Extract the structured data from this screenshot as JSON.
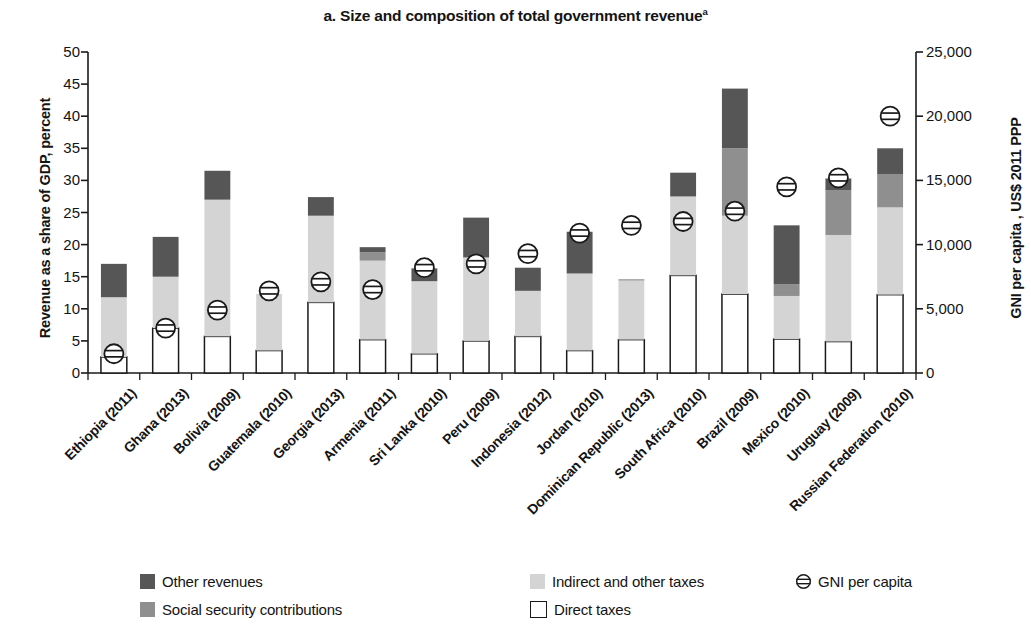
{
  "chart_data": {
    "type": "bar",
    "title": "a. Size and composition of total government revenue",
    "title_superscript": "a",
    "stacked": true,
    "xlabel": "",
    "ylabel": "Revenue as a share of GDP, percent",
    "ylabel_right": "GNI per capita , US$ 2011 PPP",
    "ylim": [
      0,
      50
    ],
    "ylim_right": [
      0,
      25000
    ],
    "yticks": [
      "0",
      "5",
      "10",
      "15",
      "20",
      "25",
      "30",
      "35",
      "40",
      "45",
      "50"
    ],
    "ytick_values": [
      0,
      5,
      10,
      15,
      20,
      25,
      30,
      35,
      40,
      45,
      50
    ],
    "yticks_right": [
      "0",
      "5,000",
      "10,000",
      "15,000",
      "20,000",
      "25,000"
    ],
    "ytick_values_right": [
      0,
      5000,
      10000,
      15000,
      20000,
      25000
    ],
    "grid": false,
    "legend_position": "bottom",
    "categories": [
      "Ethiopia (2011)",
      "Ghana (2013)",
      "Bolivia (2009)",
      "Guatemala (2010)",
      "Georgia (2013)",
      "Armenia (2011)",
      "Sri Lanka (2010)",
      "Peru (2009)",
      "Indonesia (2012)",
      "Jordan (2010)",
      "Dominican Republic (2013)",
      "South Africa (2010)",
      "Brazil (2009)",
      "Mexico (2010)",
      "Uruguay (2009)",
      "Russian Federation (2010)"
    ],
    "series": [
      {
        "name": "Direct taxes",
        "color": "#ffffff",
        "stroke": "#1a1a1a",
        "values": [
          2.5,
          7.0,
          5.7,
          3.5,
          11.0,
          5.2,
          3.0,
          5.0,
          5.7,
          3.5,
          5.2,
          15.2,
          12.3,
          5.3,
          4.9,
          12.2
        ]
      },
      {
        "name": "Indirect and other taxes",
        "color": "#d4d4d4",
        "values": [
          9.3,
          8.0,
          21.3,
          8.8,
          13.5,
          12.3,
          11.3,
          13.0,
          7.1,
          12.0,
          9.2,
          12.3,
          12.2,
          6.7,
          16.6,
          13.6
        ]
      },
      {
        "name": "Social security contributions",
        "color": "#8f8f8f",
        "values": [
          0.0,
          0.0,
          0.0,
          0.0,
          0.0,
          1.3,
          0.0,
          0.0,
          0.0,
          0.0,
          0.2,
          0.0,
          10.5,
          1.8,
          7.0,
          5.2
        ]
      },
      {
        "name": "Other revenues",
        "color": "#565656",
        "values": [
          5.2,
          6.2,
          4.5,
          0.0,
          2.9,
          0.8,
          2.0,
          6.2,
          3.6,
          6.5,
          0.0,
          3.7,
          9.3,
          9.2,
          1.8,
          4.0
        ]
      }
    ],
    "totals": [
      17.0,
      21.2,
      31.5,
      12.3,
      27.4,
      19.6,
      16.3,
      24.2,
      16.4,
      22.0,
      14.6,
      31.2,
      44.3,
      23.0,
      30.3,
      35.0
    ],
    "gni_series": {
      "name": "GNI per capita",
      "marker": "circle-with-two-lines",
      "axis": "right",
      "values": [
        1500,
        3500,
        4900,
        6400,
        7100,
        6500,
        8200,
        8500,
        9300,
        10900,
        11500,
        11800,
        12600,
        14500,
        15200,
        20000
      ],
      "values_on_left_scale": [
        3.0,
        7.0,
        9.8,
        12.8,
        14.2,
        13.0,
        16.4,
        17.0,
        18.6,
        21.8,
        23.0,
        23.6,
        25.2,
        29.0,
        30.4,
        40.0
      ]
    },
    "legend": [
      {
        "label": "Other revenues",
        "type": "swatch",
        "color": "#565656"
      },
      {
        "label": "Indirect and other taxes",
        "type": "swatch",
        "color": "#d4d4d4"
      },
      {
        "label": "GNI per capita",
        "type": "marker",
        "color": "#1a1a1a"
      },
      {
        "label": "Social security contributions",
        "type": "swatch",
        "color": "#8f8f8f"
      },
      {
        "label": "Direct taxes",
        "type": "swatch",
        "color": "#ffffff"
      }
    ]
  }
}
